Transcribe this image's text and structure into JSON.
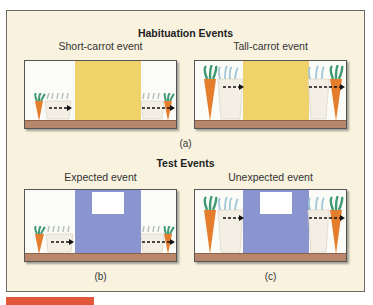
{
  "habituation": {
    "title": "Habituation Events",
    "panels": [
      {
        "title": "Short-carrot event",
        "carrot": "short"
      },
      {
        "title": "Tall-carrot event",
        "carrot": "tall"
      }
    ],
    "caption": "(a)"
  },
  "test": {
    "title": "Test Events",
    "panels": [
      {
        "title": "Expected event",
        "carrot": "short",
        "caption": "(b)"
      },
      {
        "title": "Unexpected event",
        "carrot": "tall",
        "caption": "(c)"
      }
    ]
  },
  "colors": {
    "background": "#f8f2df",
    "habituation_screen": "#efd36a",
    "test_screen": "#8a95cf",
    "ground": "#b8866a",
    "carrot_orange": "#e57e2c",
    "carrot_white": "#f3efe4",
    "leaf_green": "#3f9a74",
    "leaf_blue": "#9fc7d8",
    "accent_bar": "#e0573b"
  }
}
